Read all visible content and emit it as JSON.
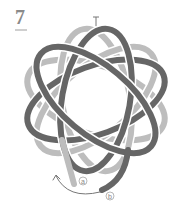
{
  "step": {
    "number": "7"
  },
  "labels": {
    "a": "a",
    "b": "b"
  },
  "colors": {
    "light_strand": "#bdbdbd",
    "dark_strand": "#666666",
    "outline": "#ffffff",
    "arrow": "#777777",
    "label": "#888888"
  }
}
